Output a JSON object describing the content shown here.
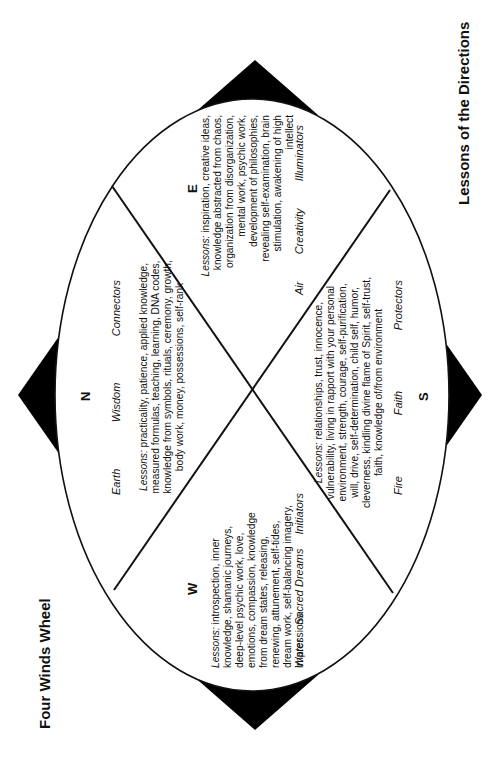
{
  "titles": {
    "main": "Four Winds Wheel",
    "secondary": "Lessons of the Directions"
  },
  "colors": {
    "line": "#111111",
    "fill": "#000000",
    "background": "#ffffff"
  },
  "directions": {
    "north": {
      "letter": "N",
      "element": "Earth",
      "quality": "Wisdom",
      "role": "Connectors",
      "lessons_label": "Lessons:",
      "lessons": "practicality, patience, applied knowledge, measured formulas, teaching, learning, DNA codes, knowledge from symbols, rituals, ceremony, growth, body work, money, possessions, self-rank"
    },
    "east": {
      "letter": "E",
      "element": "Air",
      "quality": "Creativity",
      "role": "Illuminators",
      "lessons_label": "Lessons:",
      "lessons": "inspiration, creative ideas, knowledge abstracted from chaos, organization from disorganization, mental work, psychic work, development of philosophies, revealing self-examination, brain stimulation, awakening of high intellect"
    },
    "south": {
      "letter": "S",
      "element": "Fire",
      "quality": "Faith",
      "role": "Protectors",
      "lessons_label": "Lessons:",
      "lessons": "relationships, trust, innocence, vulnerability, living in rapport with your personal environment, strength, courage, self-purification, will, drive, self-determination, child self, humor, cleverness, kindling divine flame of Spirit, self-trust, faith, knowledge of/from environment"
    },
    "west": {
      "letter": "W",
      "element": "Water",
      "quality": "Sacred Dreams",
      "role": "Initiators",
      "lessons_label": "Lessons:",
      "lessons": "introspection, inner knowledge, shamanic journeys, deep-level psychic work, love, emotions, compassion, knowledge from dream states, releasing, renewing, attunement, self-tides, dream work, self-balancing imagery, impressions"
    }
  }
}
